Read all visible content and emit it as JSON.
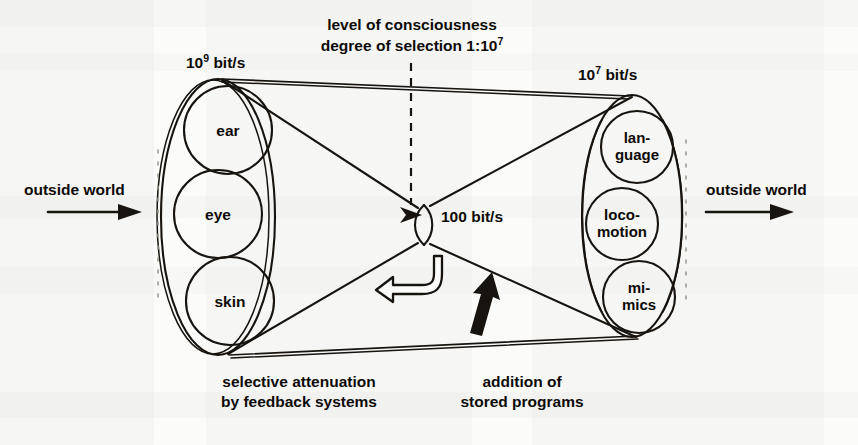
{
  "figure": {
    "background_color": "#fbfbf9",
    "ink_color": "#17140f"
  },
  "labels": {
    "input_rate_mantissa": "10",
    "input_rate_exponent": "9",
    "input_rate_unit": " bit/s",
    "output_rate_mantissa": "10",
    "output_rate_exponent": "7",
    "output_rate_unit": " bit/s",
    "waist_rate": "100 bit/s",
    "consciousness_line1": "level of consciousness",
    "consciousness_line2_pre": "degree of selection 1:10",
    "consciousness_line2_exp": "7",
    "outside_world_left": "outside world",
    "outside_world_right": "outside world",
    "feedback_line1": "selective attenuation",
    "feedback_line2": "by feedback systems",
    "programs_line1": "addition of",
    "programs_line2": "stored programs"
  },
  "input_senses": [
    {
      "id": "ear",
      "label": "ear"
    },
    {
      "id": "eye",
      "label": "eye"
    },
    {
      "id": "skin",
      "label": "skin"
    }
  ],
  "output_effectors": [
    {
      "id": "language",
      "line1": "lan-",
      "line2": "guage"
    },
    {
      "id": "locomotion",
      "line1": "loco-",
      "line2": "motion"
    },
    {
      "id": "mimics",
      "line1": "mi-",
      "line2": "mics"
    }
  ],
  "annotations": {
    "feedback_arrow": "hollow-hook-arrow-left",
    "programs_arrow": "solid-arrow-up",
    "consciousness_pointer": "solid-arrow-right-into-waist",
    "input_arrow": "arrow-right",
    "output_arrow": "arrow-right"
  }
}
